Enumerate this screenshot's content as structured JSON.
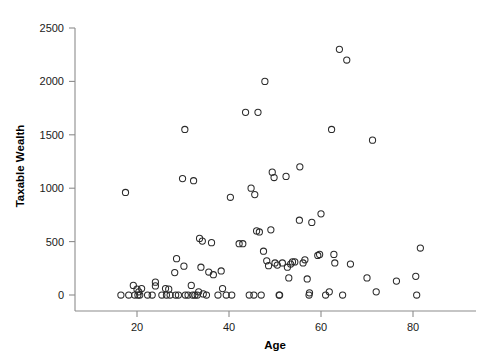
{
  "chart_data": {
    "type": "scatter",
    "title": "",
    "xlabel": "Age",
    "ylabel": "Taxable Wealth",
    "xlim": [
      13,
      85
    ],
    "ylim": [
      -130,
      2620
    ],
    "xticks": [
      20,
      40,
      60,
      80
    ],
    "yticks": [
      0,
      500,
      1000,
      1500,
      2000,
      2500
    ],
    "xtick_labels": [
      "20",
      "40",
      "60",
      "80"
    ],
    "ytick_labels": [
      "0",
      "500",
      "1000",
      "1500",
      "2000",
      "2500"
    ],
    "grid": false,
    "legend": null,
    "marker": "open-circle",
    "marker_color": "#2b2b2b",
    "points": [
      {
        "x": 17.5,
        "y": 960
      },
      {
        "x": 16.5,
        "y": 0
      },
      {
        "x": 18.2,
        "y": 0
      },
      {
        "x": 19.2,
        "y": 90
      },
      {
        "x": 19.5,
        "y": 0
      },
      {
        "x": 20.0,
        "y": 55
      },
      {
        "x": 20.2,
        "y": 0
      },
      {
        "x": 20.4,
        "y": 30
      },
      {
        "x": 20.6,
        "y": 0
      },
      {
        "x": 21.0,
        "y": 60
      },
      {
        "x": 22.3,
        "y": 0
      },
      {
        "x": 23.3,
        "y": 0
      },
      {
        "x": 24.0,
        "y": 120
      },
      {
        "x": 24.0,
        "y": 85
      },
      {
        "x": 25.4,
        "y": 0
      },
      {
        "x": 26.2,
        "y": 60
      },
      {
        "x": 26.4,
        "y": 0
      },
      {
        "x": 26.9,
        "y": 55
      },
      {
        "x": 27.2,
        "y": 0
      },
      {
        "x": 28.2,
        "y": 210
      },
      {
        "x": 28.6,
        "y": 340
      },
      {
        "x": 28.4,
        "y": 0
      },
      {
        "x": 29.0,
        "y": 0
      },
      {
        "x": 29.9,
        "y": 1090
      },
      {
        "x": 30.2,
        "y": 270
      },
      {
        "x": 30.4,
        "y": 1550
      },
      {
        "x": 30.5,
        "y": 0
      },
      {
        "x": 31.1,
        "y": 0
      },
      {
        "x": 31.8,
        "y": 90
      },
      {
        "x": 32.1,
        "y": 0
      },
      {
        "x": 32.3,
        "y": 1070
      },
      {
        "x": 32.6,
        "y": 0
      },
      {
        "x": 33.1,
        "y": 0
      },
      {
        "x": 33.4,
        "y": 30
      },
      {
        "x": 33.6,
        "y": 530
      },
      {
        "x": 33.9,
        "y": 260
      },
      {
        "x": 34.2,
        "y": 505
      },
      {
        "x": 34.4,
        "y": 10
      },
      {
        "x": 35.1,
        "y": 0
      },
      {
        "x": 35.6,
        "y": 215
      },
      {
        "x": 36.2,
        "y": 490
      },
      {
        "x": 36.6,
        "y": 190
      },
      {
        "x": 37.6,
        "y": 0
      },
      {
        "x": 38.3,
        "y": 225
      },
      {
        "x": 38.6,
        "y": 60
      },
      {
        "x": 39.4,
        "y": 0
      },
      {
        "x": 40.3,
        "y": 915
      },
      {
        "x": 40.6,
        "y": 0
      },
      {
        "x": 42.2,
        "y": 480
      },
      {
        "x": 43.0,
        "y": 480
      },
      {
        "x": 43.6,
        "y": 1710
      },
      {
        "x": 44.4,
        "y": 0
      },
      {
        "x": 44.8,
        "y": 1000
      },
      {
        "x": 45.6,
        "y": 940
      },
      {
        "x": 45.4,
        "y": 0
      },
      {
        "x": 46.0,
        "y": 600
      },
      {
        "x": 46.3,
        "y": 1710
      },
      {
        "x": 46.6,
        "y": 590
      },
      {
        "x": 47.0,
        "y": 0
      },
      {
        "x": 47.5,
        "y": 410
      },
      {
        "x": 47.8,
        "y": 2000
      },
      {
        "x": 48.2,
        "y": 320
      },
      {
        "x": 48.6,
        "y": 275
      },
      {
        "x": 49.1,
        "y": 610
      },
      {
        "x": 49.4,
        "y": 1150
      },
      {
        "x": 49.8,
        "y": 1100
      },
      {
        "x": 50.0,
        "y": 300
      },
      {
        "x": 50.5,
        "y": 280
      },
      {
        "x": 50.9,
        "y": 0
      },
      {
        "x": 51.0,
        "y": 0
      },
      {
        "x": 51.6,
        "y": 300
      },
      {
        "x": 52.4,
        "y": 1110
      },
      {
        "x": 52.7,
        "y": 260
      },
      {
        "x": 53.0,
        "y": 160
      },
      {
        "x": 53.4,
        "y": 290
      },
      {
        "x": 53.8,
        "y": 310
      },
      {
        "x": 54.3,
        "y": 310
      },
      {
        "x": 55.3,
        "y": 700
      },
      {
        "x": 55.4,
        "y": 1200
      },
      {
        "x": 56.1,
        "y": 300
      },
      {
        "x": 56.5,
        "y": 330
      },
      {
        "x": 57.0,
        "y": 150
      },
      {
        "x": 57.4,
        "y": 0
      },
      {
        "x": 57.5,
        "y": 20
      },
      {
        "x": 58.0,
        "y": 680
      },
      {
        "x": 59.3,
        "y": 370
      },
      {
        "x": 59.7,
        "y": 380
      },
      {
        "x": 60.0,
        "y": 760
      },
      {
        "x": 61.0,
        "y": 0
      },
      {
        "x": 61.8,
        "y": 30
      },
      {
        "x": 62.3,
        "y": 1550
      },
      {
        "x": 62.8,
        "y": 380
      },
      {
        "x": 63.0,
        "y": 300
      },
      {
        "x": 64.0,
        "y": 2300
      },
      {
        "x": 64.7,
        "y": 0
      },
      {
        "x": 65.6,
        "y": 2200
      },
      {
        "x": 66.4,
        "y": 290
      },
      {
        "x": 70.0,
        "y": 160
      },
      {
        "x": 71.2,
        "y": 1450
      },
      {
        "x": 72.0,
        "y": 30
      },
      {
        "x": 76.4,
        "y": 130
      },
      {
        "x": 80.6,
        "y": 175
      },
      {
        "x": 80.8,
        "y": 0
      },
      {
        "x": 81.6,
        "y": 440
      }
    ]
  }
}
